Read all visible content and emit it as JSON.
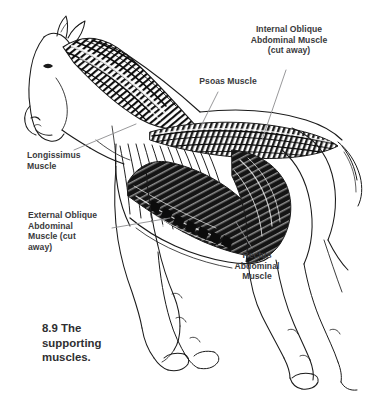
{
  "figure": {
    "caption": "8.9 The\nsupporting\nmuscles.",
    "background_color": "#ffffff",
    "ink_color": "#1a1a1a",
    "label_color": "#3a3a3c",
    "leader_line_color": "#8c8c8e"
  },
  "labels": [
    {
      "id": "internal-oblique",
      "text": "Internal Oblique\nAbdominal Muscle\n(cut away)",
      "align": "center"
    },
    {
      "id": "psoas",
      "text": "Psoas Muscle",
      "align": "center"
    },
    {
      "id": "longissimus",
      "text": "Longissimus\nMuscle",
      "align": "left"
    },
    {
      "id": "external-oblique",
      "text": "External Oblique\nAbdominal\nMuscle (cut\naway)",
      "align": "left"
    },
    {
      "id": "rectus",
      "text": "Rectus\nAbdominal\nMuscle",
      "align": "center"
    }
  ]
}
